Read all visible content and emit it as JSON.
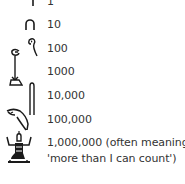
{
  "rows": [
    {
      "value": "1",
      "glyph": "stroke-icon"
    },
    {
      "value": "10",
      "glyph": "heel-bone-icon"
    },
    {
      "value": "100",
      "glyph": "coil-of-rope-icon"
    },
    {
      "value": "1000",
      "glyph": "lotus-plant-icon"
    },
    {
      "value": "10,000",
      "glyph": "finger-icon"
    },
    {
      "value": "100,000",
      "glyph": "tadpole-icon"
    },
    {
      "value": "1,000,000 (often meaning",
      "glyph": "heh-god-icon"
    },
    {
      "value": "'more than I can count')",
      "glyph": ""
    }
  ],
  "colors": {
    "ink": "#1a1a1a",
    "text": "#333333",
    "background": "#ffffff"
  }
}
